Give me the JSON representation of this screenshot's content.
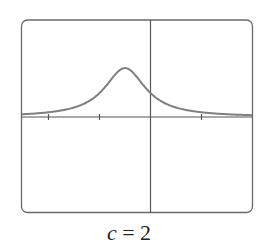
{
  "chart_data": {
    "type": "line",
    "title": "",
    "caption": {
      "variable": "c",
      "equals": "=",
      "value": "2"
    },
    "xlabel": "",
    "ylabel": "",
    "xlim": [
      -2.53,
      2.0
    ],
    "ylim": [
      -1.88,
      2.0
    ],
    "x_ticks": [
      -2,
      -1,
      1
    ],
    "grid": false,
    "legend": null,
    "series": [
      {
        "name": "f(x)",
        "x": [
          -2.53,
          -2.0,
          -1.5,
          -1.25,
          -1.0,
          -0.75,
          -0.5,
          -0.25,
          0.0,
          0.25,
          0.5,
          1.0,
          1.5,
          2.0
        ],
        "y": [
          0.06,
          0.08,
          0.19,
          0.3,
          0.49,
          0.8,
          0.96,
          0.8,
          0.49,
          0.3,
          0.19,
          0.1,
          0.06,
          0.05
        ]
      }
    ],
    "colors": {
      "curve": "#7f7f7f",
      "axes": "#555555",
      "frame": "#6a6a6a"
    }
  }
}
